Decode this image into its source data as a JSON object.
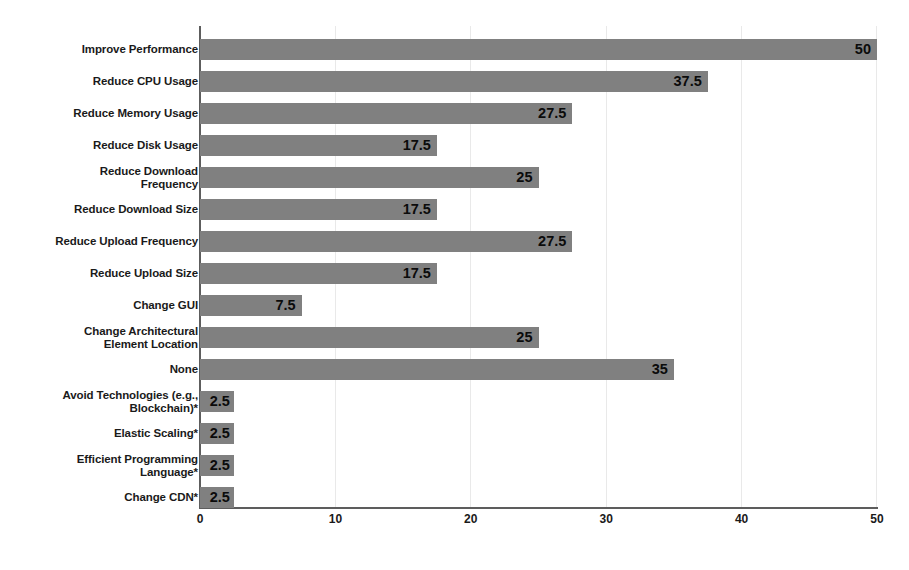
{
  "chart_data": {
    "type": "bar",
    "orientation": "horizontal",
    "title": "",
    "xlabel": "",
    "ylabel": "",
    "xlim": [
      0,
      50
    ],
    "xticks": [
      0,
      10,
      20,
      30,
      40,
      50
    ],
    "xtick_labels": [
      "0",
      "10",
      "20",
      "30",
      "40",
      "50"
    ],
    "grid": "vertical",
    "legend": "none",
    "bar_color": "#808080",
    "axis_color": "#5d5d5d",
    "gridline_color": "#e9e9e9",
    "categories": [
      "Improve Performance",
      "Reduce CPU Usage",
      "Reduce Memory Usage",
      "Reduce Disk Usage",
      "Reduce Download\nFrequency",
      "Reduce Download Size",
      "Reduce Upload Frequency",
      "Reduce Upload Size",
      "Change GUI",
      "Change Architectural\nElement Location",
      "None",
      "Avoid Technologies (e.g.,\nBlockchain)*",
      "Elastic Scaling*",
      "Efficient Programming\nLanguage*",
      "Change CDN*"
    ],
    "values": [
      50,
      37.5,
      27.5,
      17.5,
      25,
      17.5,
      27.5,
      17.5,
      7.5,
      25,
      35,
      2.5,
      2.5,
      2.5,
      2.5
    ],
    "value_labels": [
      "50",
      "37.5",
      "27.5",
      "17.5",
      "25",
      "17.5",
      "27.5",
      "17.5",
      "7.5",
      "25",
      "35",
      "2.5",
      "2.5",
      "2.5",
      "2.5"
    ]
  }
}
